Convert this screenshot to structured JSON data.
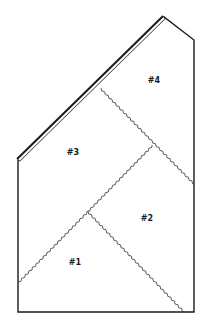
{
  "diagram": {
    "title": "",
    "outline_color": "#1a1a1a",
    "seam_color": "#333333",
    "pieces": [
      {
        "id": "piece-4",
        "label": "#4",
        "x": 154,
        "y": 83
      },
      {
        "id": "piece-3",
        "label": "#3",
        "x": 73,
        "y": 155
      },
      {
        "id": "piece-2",
        "label": "#2",
        "x": 147,
        "y": 221
      },
      {
        "id": "piece-1",
        "label": "#1",
        "x": 75,
        "y": 265
      }
    ],
    "outline_points": "18,160 164,17 194,40 194,312 18,312",
    "roof_edge": {
      "x1": 18,
      "y1": 160,
      "x2": 164,
      "y2": 17
    },
    "seams": [
      {
        "id": "seam-top",
        "x1": 101,
        "y1": 88,
        "x2": 194,
        "y2": 183
      },
      {
        "id": "seam-left",
        "x1": 18,
        "y1": 282,
        "x2": 152,
        "y2": 145
      },
      {
        "id": "seam-lower",
        "x1": 88,
        "y1": 211,
        "x2": 185,
        "y2": 312
      }
    ]
  }
}
